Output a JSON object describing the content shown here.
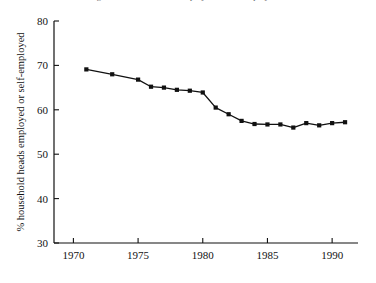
{
  "figure": {
    "top_cropped_caption": "Percentage of household heads employed or self-employed"
  },
  "chart_data": {
    "type": "line",
    "title": "",
    "subtitle": "",
    "xlabel": "",
    "ylabel": "% household heads employed or self-employed",
    "xlim": [
      1968.5,
      1992.0
    ],
    "ylim": [
      30,
      80
    ],
    "xticks": [
      1970,
      1975,
      1980,
      1985,
      1990
    ],
    "xticklabels": [
      "1970",
      "1975",
      "1980",
      "1985",
      "1990"
    ],
    "yticks": [
      30,
      40,
      50,
      60,
      70,
      80
    ],
    "yticklabels": [
      "30",
      "40",
      "50",
      "60",
      "70",
      "80"
    ],
    "grid": false,
    "legend": null,
    "marker": "filled-square",
    "line_color": "#111111",
    "marker_color": "#111111",
    "series": [
      {
        "name": "% household heads employed or self-employed",
        "x": [
          1971,
          1973,
          1975,
          1976,
          1977,
          1978,
          1979,
          1980,
          1981,
          1982,
          1983,
          1984,
          1985,
          1986,
          1987,
          1988,
          1989,
          1990,
          1991
        ],
        "values": [
          69.1,
          68.0,
          66.8,
          65.2,
          65.0,
          64.5,
          64.3,
          63.9,
          60.5,
          59.0,
          57.5,
          56.8,
          56.7,
          56.7,
          56.0,
          57.0,
          56.5,
          57.0,
          57.2
        ]
      }
    ]
  },
  "axes": {
    "y_axis_name": "y-axis",
    "x_axis_name": "x-axis"
  }
}
